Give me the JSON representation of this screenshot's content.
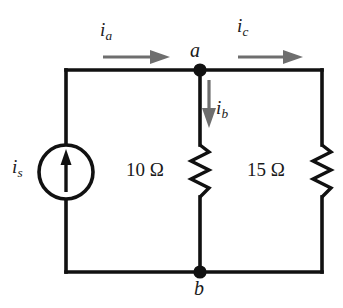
{
  "figure": {
    "type": "circuit-schematic",
    "title": "",
    "width": 343,
    "height": 308,
    "background": "#ffffff"
  },
  "colors": {
    "wire": "#111111",
    "node_dot": "#111111",
    "arrow_gray": "#6e6e6e",
    "text": "#1a1a1a"
  },
  "labels": {
    "current_ia": {
      "symbol": "i",
      "subscript": "a"
    },
    "current_ib": {
      "symbol": "i",
      "subscript": "b"
    },
    "current_ic": {
      "symbol": "i",
      "subscript": "c"
    },
    "source_is": {
      "symbol": "i",
      "subscript": "s"
    },
    "node_a": "a",
    "node_b": "b"
  },
  "components": [
    {
      "id": "current-source",
      "kind": "independent-current-source",
      "label": "i_s",
      "direction": "up",
      "position": {
        "cx": 66,
        "cy": 172,
        "r": 27
      }
    },
    {
      "id": "resistor-r1",
      "kind": "resistor",
      "value": "10",
      "unit": "Ω",
      "label": "10 Ω",
      "position": {
        "x": 200,
        "y1": 145,
        "y2": 197
      }
    },
    {
      "id": "resistor-r2",
      "kind": "resistor",
      "value": "15",
      "unit": "Ω",
      "label": "15 Ω",
      "position": {
        "x": 322,
        "y1": 145,
        "y2": 197
      }
    }
  ],
  "nodes": [
    {
      "id": "node-a",
      "label": "a",
      "x": 200,
      "y": 70
    },
    {
      "id": "node-b",
      "label": "b",
      "x": 200,
      "y": 272
    }
  ],
  "currents": [
    {
      "id": "ia",
      "label": "i_a",
      "branch": "top-left-wire",
      "direction": "right"
    },
    {
      "id": "ib",
      "label": "i_b",
      "branch": "middle-branch",
      "direction": "down"
    },
    {
      "id": "ic",
      "label": "i_c",
      "branch": "top-right-wire",
      "direction": "right"
    }
  ],
  "resistor_values": {
    "r1_text": "10 Ω",
    "r2_text": "15 Ω"
  }
}
